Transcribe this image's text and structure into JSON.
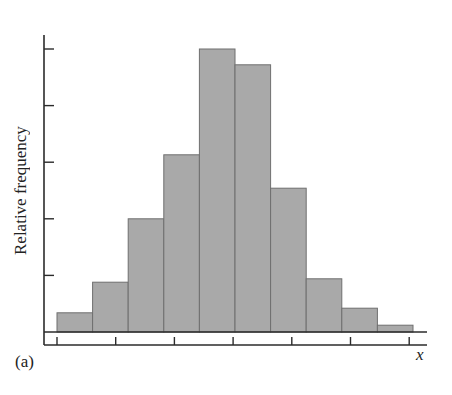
{
  "chart_data": {
    "type": "bar",
    "subtype": "histogram",
    "title": "",
    "panel_label": "(a)",
    "xlabel": "x",
    "ylabel": "Relative frequency",
    "categories": [
      "bin1",
      "bin2",
      "bin3",
      "bin4",
      "bin5",
      "bin6",
      "bin7",
      "bin8",
      "bin9",
      "bin10"
    ],
    "values": [
      0.34,
      0.88,
      2.0,
      3.13,
      5.0,
      4.72,
      2.54,
      0.94,
      0.42,
      0.12
    ],
    "value_units": "y-axis tick intervals (unlabeled)",
    "y_ticks": [
      1,
      2,
      3,
      4,
      5
    ],
    "y_tick_labels": [],
    "x_tick_count": 7,
    "x_tick_labels": [],
    "ylim": [
      0,
      5.5
    ],
    "grid": false,
    "legend": null,
    "colors": {
      "bar_fill": "#a9a9a9",
      "bar_edge": "#6f6f6f",
      "axis": "#2b2b2b"
    }
  }
}
